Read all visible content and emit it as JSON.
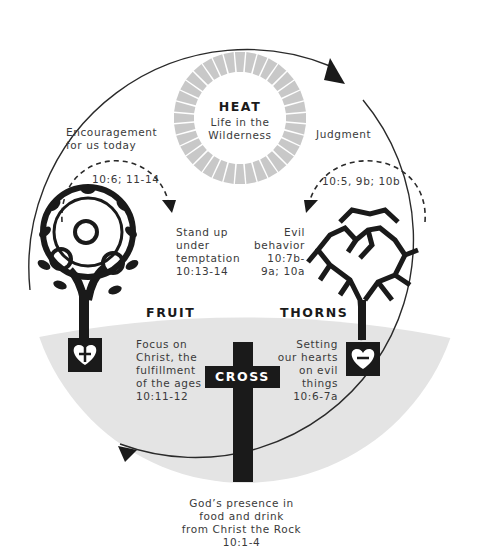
{
  "heat": {
    "title": "HEAT",
    "subtitle_line1": "Life in the",
    "subtitle_line2": "Wilderness"
  },
  "encouragement": {
    "line1": "Encouragement",
    "line2": "for us today",
    "ref": "10:6; 11-14"
  },
  "judgment": {
    "label": "Judgment",
    "ref": "10:5, 9b; 10b"
  },
  "stand_up": {
    "lines": [
      "Stand up",
      "under",
      "temptation",
      "10:13-14"
    ]
  },
  "evil_behavior": {
    "lines": [
      "Evil",
      "behavior",
      "10:7b-",
      "9a; 10a"
    ]
  },
  "fruit": {
    "title": "FRUIT",
    "lines": [
      "Focus on",
      "Christ, the",
      "fulfillment",
      "of the ages",
      "10:11-12"
    ],
    "heart_symbol": "+"
  },
  "thorns": {
    "title": "THORNS",
    "lines": [
      "Setting",
      "our hearts",
      "on evil",
      "things",
      "10:6-7a"
    ],
    "heart_symbol": "−"
  },
  "cross": {
    "label": "CROSS"
  },
  "bottom": {
    "lines": [
      "God’s presence in",
      "food and drink",
      "from Christ the Rock",
      "10:1-4"
    ]
  },
  "colors": {
    "ink": "#1a1a1a",
    "ground": "#e4e4e4",
    "sun_rays": "#c8c8c8",
    "text": "#3a3a3a"
  }
}
